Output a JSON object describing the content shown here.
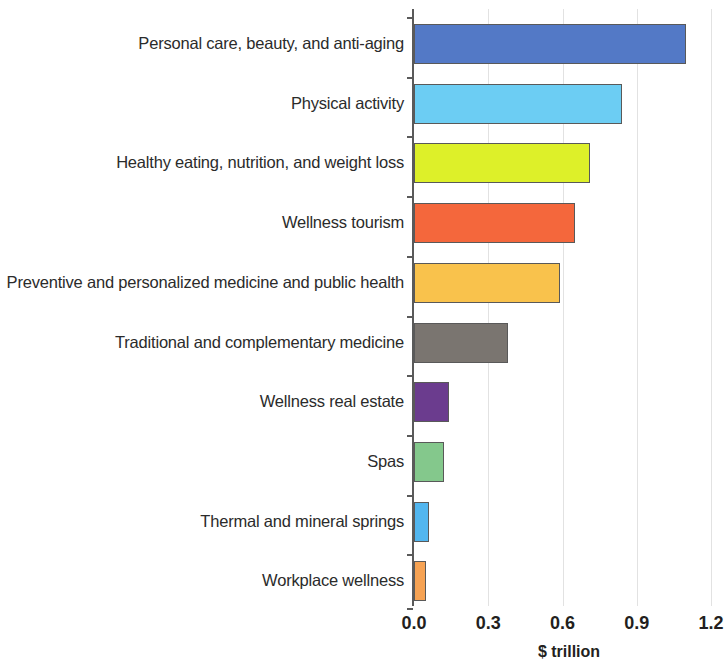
{
  "chart_data": {
    "type": "bar",
    "orientation": "horizontal",
    "title": "",
    "subtitle": "",
    "xlabel": "$ trillion",
    "ylabel": "",
    "xlim": [
      0.0,
      1.2
    ],
    "xticks": [
      "0.0",
      "0.3",
      "0.6",
      "0.9",
      "1.2"
    ],
    "xtick_values": [
      0.0,
      0.3,
      0.6,
      0.9,
      1.2
    ],
    "grid": "vertical",
    "legend": "none",
    "categories": [
      "Personal care, beauty, and anti-aging",
      "Physical activity",
      "Healthy eating, nutrition, and weight loss",
      "Wellness tourism",
      "Preventive and personalized medicine and public health",
      "Traditional and complementary medicine",
      "Wellness real estate",
      "Spas",
      "Thermal and mineral springs",
      "Workplace wellness"
    ],
    "values": [
      1.1,
      0.84,
      0.71,
      0.65,
      0.59,
      0.38,
      0.14,
      0.12,
      0.06,
      0.05
    ],
    "colors": [
      "#5379c6",
      "#6ccdf3",
      "#ddf029",
      "#f4673c",
      "#f9c24c",
      "#7a7570",
      "#6b3c8e",
      "#84c88c",
      "#52b6ef",
      "#f6a253"
    ],
    "bar_outline_color": "#595959",
    "axis_color": "#5a5a5a",
    "gridline_color": "#e2e2e2",
    "background_color": "#ffffff"
  }
}
